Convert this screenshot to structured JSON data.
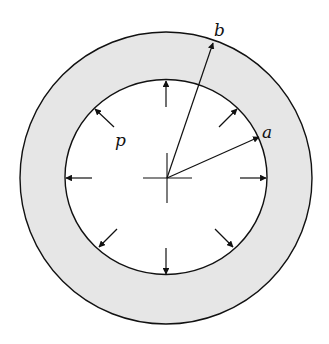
{
  "diagram": {
    "type": "thick-walled-cylinder-cross-section",
    "colors": {
      "background": "#ffffff",
      "wall_fill": "#e6e6e6",
      "line": "#111111"
    },
    "center": {
      "x": 166,
      "y": 178
    },
    "outer_circle": {
      "rx": 146,
      "ry": 146
    },
    "inner_circle": {
      "rx": 101,
      "ry": 98
    },
    "labels": {
      "inner_radius": "a",
      "outer_radius": "b",
      "pressure": "p"
    },
    "pressure_arrows": [
      {
        "name": "top",
        "x1": 166,
        "y1": 107,
        "x2": 166,
        "y2": 81
      },
      {
        "name": "bottom",
        "x1": 166,
        "y1": 248,
        "x2": 166,
        "y2": 274
      },
      {
        "name": "left",
        "x1": 92,
        "y1": 178,
        "x2": 66,
        "y2": 178
      },
      {
        "name": "right",
        "x1": 240,
        "y1": 178,
        "x2": 266,
        "y2": 178
      },
      {
        "name": "upper-left",
        "x1": 114,
        "y1": 127,
        "x2": 95,
        "y2": 109
      },
      {
        "name": "upper-right",
        "x1": 219,
        "y1": 127,
        "x2": 237,
        "y2": 109
      },
      {
        "name": "lower-left",
        "x1": 117,
        "y1": 229,
        "x2": 99,
        "y2": 247
      },
      {
        "name": "lower-right",
        "x1": 215,
        "y1": 229,
        "x2": 233,
        "y2": 247
      }
    ],
    "radius_arrows": [
      {
        "name": "radius-a",
        "x1": 167,
        "y1": 178,
        "x2": 259,
        "y2": 137
      },
      {
        "name": "radius-b",
        "x1": 167,
        "y1": 178,
        "x2": 213,
        "y2": 43
      }
    ],
    "crosshair": {
      "h_from": 143,
      "h_to": 192,
      "v_from": 153,
      "v_to": 203
    }
  }
}
